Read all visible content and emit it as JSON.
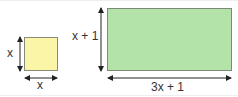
{
  "diagram": {
    "small_square": {
      "fill": "#fbf5a8",
      "stroke": "#8a8a7a",
      "height_label": "x",
      "width_label": "x"
    },
    "large_rectangle": {
      "fill": "#b3e3a8",
      "stroke": "#7a8a76",
      "height_label": "x + 1",
      "width_label": "3x + 1"
    },
    "arrow_color": "#222222"
  }
}
